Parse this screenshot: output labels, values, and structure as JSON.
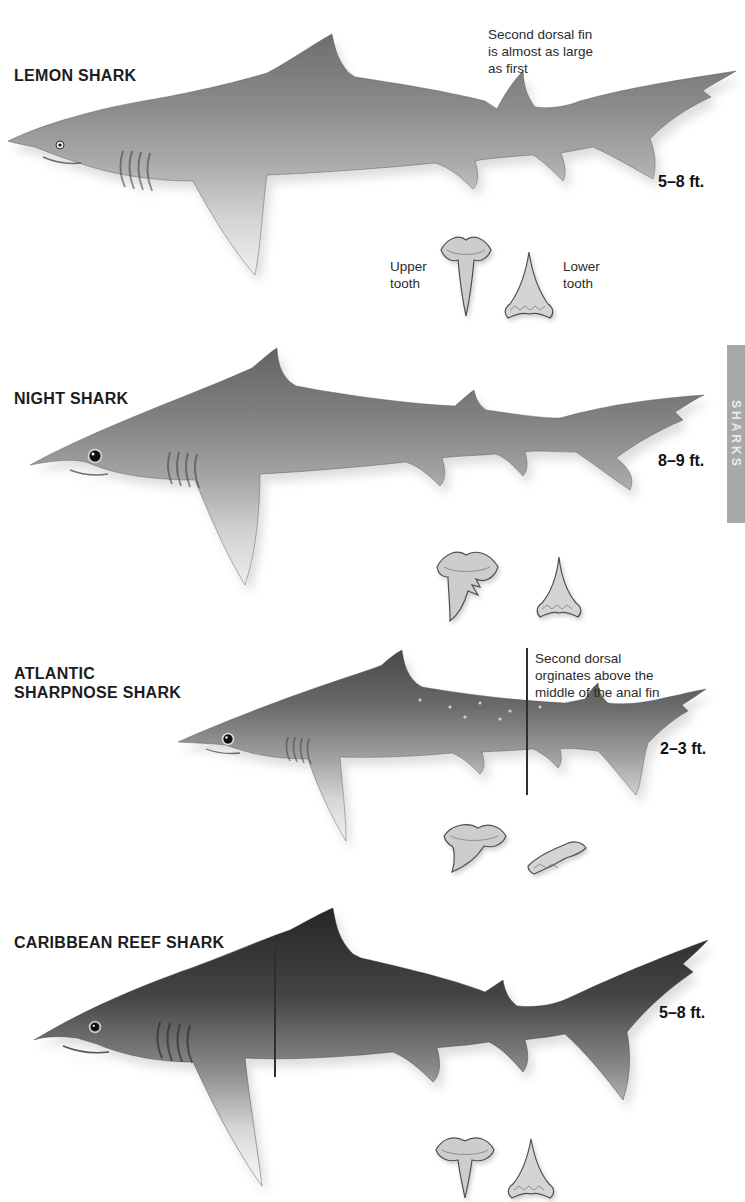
{
  "side_tab": {
    "label": "SHARKS"
  },
  "tooth_caption": {
    "upper": "Upper\ntooth",
    "lower": "Lower\ntooth"
  },
  "sections": [
    {
      "name": "LEMON SHARK",
      "size": "5–8 ft.",
      "annotation": "Second dorsal fin\nis almost as large\nas first"
    },
    {
      "name": "NIGHT SHARK",
      "size": "8–9 ft.",
      "annotation": ""
    },
    {
      "name": "ATLANTIC\nSHARPNOSE SHARK",
      "size": "2–3 ft.",
      "annotation": "Second dorsal\norginates above the\nmiddle of the anal fin"
    },
    {
      "name": "CARIBBEAN REEF SHARK",
      "size": "5–8 ft.",
      "annotation": ""
    }
  ]
}
